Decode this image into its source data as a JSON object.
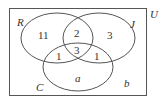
{
  "diagram": {
    "type": "venn",
    "universe_label": "U",
    "sets": [
      {
        "name": "R"
      },
      {
        "name": "J"
      },
      {
        "name": "C"
      }
    ],
    "regions": {
      "R_only": "11",
      "R_J_only": "2",
      "J_only": "3",
      "R_J_C": "3",
      "R_C_only": "1",
      "J_C_only": "1",
      "C_only": "a",
      "outside": "b"
    },
    "stroke_color": "#555555"
  }
}
